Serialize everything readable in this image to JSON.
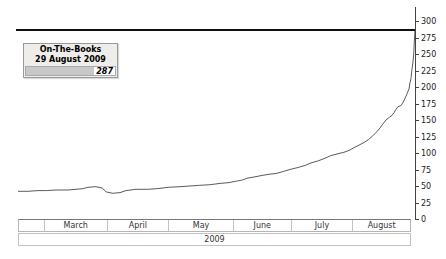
{
  "legend": {
    "title": "On-The-Books",
    "date": "29 August 2009",
    "value": "287",
    "bar_fill_pct": 76,
    "bg_color": "#efedea",
    "bar_color": "#c8c8c8"
  },
  "axis_y": {
    "ticks": [
      0,
      25,
      50,
      75,
      100,
      125,
      150,
      175,
      200,
      225,
      250,
      275,
      300
    ],
    "min": 0,
    "max": 300,
    "side": "right"
  },
  "axis_x": {
    "months": [
      "",
      "March",
      "April",
      "May",
      "June",
      "July",
      "August"
    ],
    "year": "2009"
  },
  "colors": {
    "curve": "#5a5a5a",
    "reference_line": "#111111",
    "axis": "#444444",
    "band_border": "#b5b5b5",
    "background": "#ffffff"
  },
  "chart_data": {
    "type": "line",
    "title": "On-The-Books 29 August 2009",
    "xlabel": "2009 (March - August)",
    "ylabel": "Bookings on the books",
    "ylim": [
      0,
      300
    ],
    "grid": false,
    "legend_position": "top-left",
    "reference_line_value": 287,
    "current_value": 287,
    "x_categories": [
      "March",
      "April",
      "May",
      "June",
      "July",
      "August"
    ],
    "series": [
      {
        "name": "On-The-Books",
        "x_unit": "fraction of timeline (late Feb to 29 Aug 2009)",
        "points": [
          [
            0,
            42
          ],
          [
            0.025,
            42
          ],
          [
            0.05,
            43
          ],
          [
            0.071,
            43
          ],
          [
            0.096,
            44
          ],
          [
            0.126,
            44
          ],
          [
            0.146,
            45
          ],
          [
            0.164,
            46
          ],
          [
            0.176,
            48
          ],
          [
            0.196,
            49
          ],
          [
            0.212,
            47
          ],
          [
            0.222,
            41
          ],
          [
            0.239,
            39
          ],
          [
            0.257,
            40
          ],
          [
            0.272,
            43
          ],
          [
            0.297,
            45
          ],
          [
            0.327,
            45
          ],
          [
            0.353,
            46
          ],
          [
            0.378,
            48
          ],
          [
            0.408,
            49
          ],
          [
            0.433,
            50
          ],
          [
            0.458,
            51
          ],
          [
            0.484,
            52
          ],
          [
            0.509,
            54
          ],
          [
            0.529,
            55
          ],
          [
            0.547,
            57
          ],
          [
            0.564,
            59
          ],
          [
            0.579,
            62
          ],
          [
            0.597,
            64
          ],
          [
            0.615,
            66
          ],
          [
            0.635,
            68
          ],
          [
            0.65,
            69
          ],
          [
            0.668,
            72
          ],
          [
            0.685,
            75
          ],
          [
            0.705,
            78
          ],
          [
            0.723,
            81
          ],
          [
            0.738,
            85
          ],
          [
            0.756,
            88
          ],
          [
            0.773,
            92
          ],
          [
            0.788,
            96
          ],
          [
            0.806,
            99
          ],
          [
            0.821,
            101
          ],
          [
            0.834,
            104
          ],
          [
            0.846,
            108
          ],
          [
            0.859,
            112
          ],
          [
            0.872,
            116
          ],
          [
            0.882,
            120
          ],
          [
            0.892,
            125
          ],
          [
            0.902,
            131
          ],
          [
            0.912,
            138
          ],
          [
            0.919,
            144
          ],
          [
            0.927,
            150
          ],
          [
            0.935,
            154
          ],
          [
            0.942,
            157
          ],
          [
            0.947,
            161
          ],
          [
            0.952,
            166
          ],
          [
            0.957,
            170
          ],
          [
            0.965,
            172
          ],
          [
            0.97,
            177
          ],
          [
            0.975,
            183
          ],
          [
            0.98,
            190
          ],
          [
            0.985,
            197
          ],
          [
            0.987,
            205
          ],
          [
            0.99,
            213
          ],
          [
            0.992,
            225
          ],
          [
            0.995,
            238
          ],
          [
            0.997,
            252
          ],
          [
            0.998,
            265
          ],
          [
            1,
            287
          ]
        ]
      }
    ]
  }
}
